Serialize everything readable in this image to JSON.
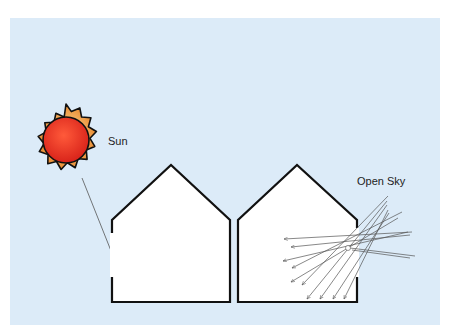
{
  "diagram": {
    "labels": {
      "sun": "Sun",
      "open_sky": "Open Sky"
    },
    "colors": {
      "background": "#dcebf8",
      "sun_core": "#e8321e",
      "sun_corona": "#f0a040",
      "outline": "#111111",
      "ray": "#555555",
      "house_fill": "#ffffff"
    },
    "elements": [
      {
        "type": "sun",
        "label": "Sun"
      },
      {
        "type": "house",
        "id": "left",
        "window_side": "left",
        "ray_source": "direct sunlight"
      },
      {
        "type": "house",
        "id": "right",
        "window_side": "right",
        "ray_source": "diffuse open sky"
      }
    ]
  }
}
